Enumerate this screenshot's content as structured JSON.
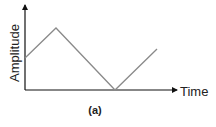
{
  "figure": {
    "label": "(a)",
    "x_axis_label": "Time",
    "y_axis_label": "Amplitude"
  },
  "colors": {
    "axis": "#111111",
    "wave": "#8a8a8a",
    "text": "#222222"
  },
  "waveform": {
    "type": "triangle",
    "points": [
      [
        25,
        58
      ],
      [
        56,
        28
      ],
      [
        115,
        90
      ],
      [
        157,
        49
      ]
    ]
  }
}
